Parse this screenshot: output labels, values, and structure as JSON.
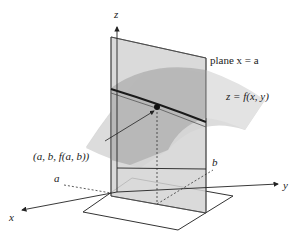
{
  "figure": {
    "type": "3d-surface-cross-section",
    "axes": {
      "x_label": "x",
      "y_label": "y",
      "z_label": "z"
    },
    "labels": {
      "plane": "plane x = a",
      "surface": "z = f(x, y)",
      "point": "(a, b, f(a, b))",
      "a_tick": "a",
      "b_tick": "b"
    },
    "colors": {
      "surface": "#cfcfcf",
      "surface_dark": "#a9a9a9",
      "plane": "#d6d6d6",
      "curve": "#1a1a1a",
      "axes": "#333333",
      "background": "#ffffff"
    }
  }
}
